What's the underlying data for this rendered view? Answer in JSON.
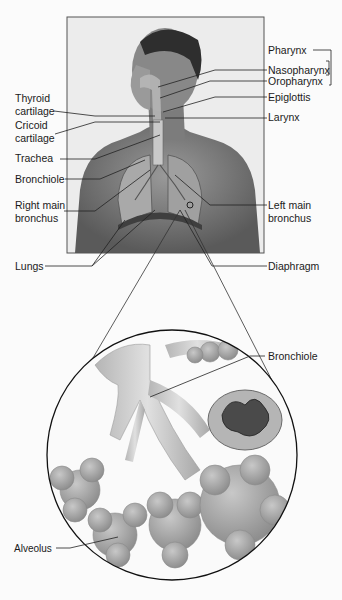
{
  "figure": {
    "photo_panel": {
      "subject": "male torso profile with airway and lungs overlay"
    },
    "right_labels": [
      {
        "id": "pharynx",
        "text": "Pharynx"
      },
      {
        "id": "nasopharynx",
        "text": "Nasopharynx"
      },
      {
        "id": "oropharynx",
        "text": "Oropharynx"
      },
      {
        "id": "epiglottis",
        "text": "Epiglottis"
      },
      {
        "id": "larynx",
        "text": "Larynx"
      },
      {
        "id": "left-main-bronchus",
        "text": "Left main bronchus",
        "line1": "Left main",
        "line2": "bronchus"
      },
      {
        "id": "diaphragm",
        "text": "Diaphragm"
      }
    ],
    "left_labels": [
      {
        "id": "thyroid-cartilage",
        "line1": "Thyroid",
        "line2": "cartilage"
      },
      {
        "id": "cricoid-cartilage",
        "line1": "Cricoid",
        "line2": "cartilage"
      },
      {
        "id": "trachea",
        "text": "Trachea"
      },
      {
        "id": "bronchiole",
        "text": "Bronchiole"
      },
      {
        "id": "right-main-bronchus",
        "line1": "Right main",
        "line2": "bronchus"
      },
      {
        "id": "lungs",
        "text": "Lungs"
      }
    ],
    "inset": {
      "description": "magnified view of bronchiole and alveoli",
      "labels": [
        {
          "id": "inset-bronchiole",
          "text": "Bronchiole"
        },
        {
          "id": "alveolus",
          "text": "Alveolus"
        }
      ]
    },
    "colors": {
      "line": "#222222",
      "photo_bg": "#e9e9e9",
      "skin": "#8a8a8a",
      "alveoli": "#9d9d9d"
    }
  }
}
